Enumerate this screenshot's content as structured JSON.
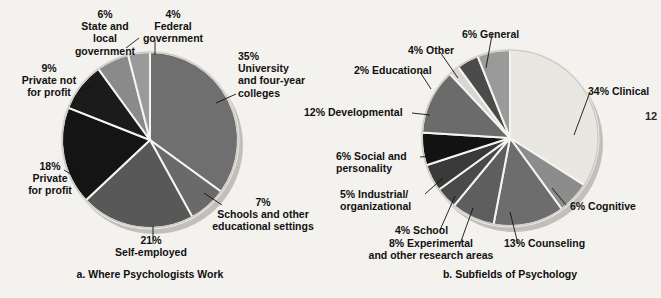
{
  "page": {
    "background_color": "#f4f2ee",
    "page_number": "12"
  },
  "charts": [
    {
      "id": "where-psychologists-work",
      "caption": "a. Where Psychologists Work",
      "center": [
        150,
        140
      ],
      "radius": 88,
      "labels": [
        {
          "key": "state_local",
          "text": "6%\nState and\nlocal\ngovernment",
          "align": "center",
          "x": 46,
          "y": 8,
          "w": 118
        },
        {
          "key": "federal",
          "text": "4%\nFederal\ngovernment",
          "align": "center",
          "x": 118,
          "y": 8,
          "w": 110
        },
        {
          "key": "university",
          "text": "35%\nUniversity\nand four-year\ncolleges",
          "align": "left",
          "x": 238,
          "y": 50,
          "w": 95
        },
        {
          "key": "private_not_for_profit",
          "text": "9%\nPrivate not\nfor profit",
          "align": "center",
          "x": 2,
          "y": 62,
          "w": 94
        },
        {
          "key": "private_for_profit",
          "text": "18%\nPrivate\nfor profit",
          "align": "center",
          "x": 8,
          "y": 160,
          "w": 84
        },
        {
          "key": "schools",
          "text": "7%\nSchools and other\neducational settings",
          "align": "center",
          "x": 198,
          "y": 196,
          "w": 130
        },
        {
          "key": "self_employed",
          "text": "21%\nSelf-employed",
          "align": "center",
          "x": 96,
          "y": 234,
          "w": 110
        }
      ]
    },
    {
      "id": "subfields-of-psychology",
      "caption": "b. Subfields of Psychology",
      "center": [
        510,
        138
      ],
      "radius": 88,
      "labels": [
        {
          "key": "general",
          "text": "6% General",
          "align": "left",
          "x": 462,
          "y": 28,
          "w": 80
        },
        {
          "key": "other",
          "text": "4% Other",
          "align": "left",
          "x": 408,
          "y": 44,
          "w": 70
        },
        {
          "key": "educational",
          "text": "2% Educational",
          "align": "left",
          "x": 354,
          "y": 64,
          "w": 100
        },
        {
          "key": "clinical",
          "text": "34% Clinical",
          "align": "left",
          "x": 588,
          "y": 85,
          "w": 80
        },
        {
          "key": "developmental",
          "text": "12% Developmental",
          "align": "left",
          "x": 304,
          "y": 106,
          "w": 120
        },
        {
          "key": "social",
          "text": "6% Social and\npersonality",
          "align": "left",
          "x": 336,
          "y": 150,
          "w": 96
        },
        {
          "key": "cognitive",
          "text": "6% Cognitive",
          "align": "left",
          "x": 570,
          "y": 200,
          "w": 84
        },
        {
          "key": "industrial",
          "text": "5% Industrial/\norganizational",
          "align": "left",
          "x": 340,
          "y": 188,
          "w": 100
        },
        {
          "key": "school",
          "text": "4% School",
          "align": "left",
          "x": 395,
          "y": 224,
          "w": 74
        },
        {
          "key": "counseling",
          "text": "13% Counseling",
          "align": "left",
          "x": 504,
          "y": 237,
          "w": 102
        },
        {
          "key": "experimental",
          "text": "8% Experimental\nand other research areas",
          "align": "center",
          "x": 358,
          "y": 237,
          "w": 146
        }
      ]
    }
  ],
  "chart_data": [
    {
      "type": "pie",
      "title": "a. Where Psychologists Work",
      "categories": [
        "University and four-year colleges",
        "Schools and other educational settings",
        "Self-employed",
        "Private for profit",
        "Private not for profit",
        "State and local government",
        "Federal government"
      ],
      "values": [
        35,
        7,
        21,
        18,
        9,
        6,
        4
      ],
      "value_labels": [
        "35%",
        "7%",
        "21%",
        "18%",
        "9%",
        "6%",
        "4%"
      ],
      "colors": [
        "#6f6f6f",
        "#6a6a6a",
        "#585858",
        "#141414",
        "#1b1b1b",
        "#8a8a8a",
        "#9a9a9a"
      ],
      "legend": "labels with leader lines around the pie",
      "start_angle_deg": -90,
      "direction": "clockwise",
      "grid": false
    },
    {
      "type": "pie",
      "title": "b. Subfields of Psychology",
      "categories": [
        "Clinical",
        "Cognitive",
        "Counseling",
        "Experimental and other research areas",
        "School",
        "Industrial/organizational",
        "Social and personality",
        "Developmental",
        "Educational",
        "Other",
        "General"
      ],
      "values": [
        34,
        6,
        13,
        8,
        4,
        5,
        6,
        12,
        2,
        4,
        6
      ],
      "value_labels": [
        "34%",
        "6%",
        "13%",
        "8%",
        "4%",
        "5%",
        "6%",
        "12%",
        "2%",
        "4%",
        "6%"
      ],
      "colors": [
        "#e9e7e2",
        "#8c8c8c",
        "#6d6d6d",
        "#5e5e5e",
        "#4a4a4a",
        "#3a3a3a",
        "#121212",
        "#6b6b6b",
        "#d8d6d1",
        "#4b4b4b",
        "#9a9a9a"
      ],
      "legend": "labels with leader lines around the pie",
      "start_angle_deg": -90,
      "direction": "clockwise",
      "grid": false
    }
  ]
}
